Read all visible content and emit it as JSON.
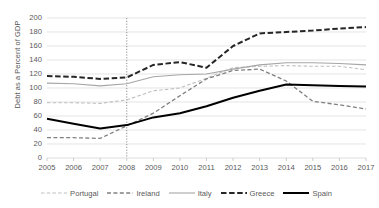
{
  "chart_data": {
    "type": "line",
    "title": "",
    "xlabel": "",
    "ylabel": "Debt as a Percent of GDP",
    "x": [
      2005,
      2006,
      2007,
      2008,
      2009,
      2010,
      2011,
      2012,
      2013,
      2014,
      2015,
      2016,
      2017
    ],
    "xlim": [
      2005,
      2017
    ],
    "ylim": [
      0,
      200
    ],
    "yticks": [
      0,
      20,
      40,
      60,
      80,
      100,
      120,
      140,
      160,
      180,
      200
    ],
    "xticks": [
      2005,
      2006,
      2007,
      2008,
      2009,
      2010,
      2011,
      2012,
      2013,
      2014,
      2015,
      2016,
      2017
    ],
    "grid": "horizontal",
    "legend_position": "bottom",
    "annotations": [
      {
        "type": "vertical-line",
        "x": 2008,
        "style": "dotted",
        "color": "#808080"
      }
    ],
    "series": [
      {
        "name": "Portugal",
        "color": "#bfbfbf",
        "style": "dashed",
        "width": 1.1,
        "values": [
          79,
          79,
          78,
          83,
          96,
          100,
          114,
          129,
          131,
          132,
          131,
          131,
          126
        ]
      },
      {
        "name": "Ireland",
        "color": "#808080",
        "style": "dashed",
        "width": 1.3,
        "values": [
          29,
          29,
          28,
          46,
          64,
          89,
          113,
          125,
          127,
          110,
          81,
          76,
          70
        ]
      },
      {
        "name": "Italy",
        "color": "#a6a6a6",
        "style": "solid",
        "width": 1.1,
        "values": [
          107,
          106,
          103,
          106,
          116,
          119,
          120,
          127,
          133,
          136,
          136,
          135,
          133
        ]
      },
      {
        "name": "Greece",
        "color": "#262626",
        "style": "dashed",
        "width": 2.0,
        "values": [
          117,
          116,
          113,
          115,
          133,
          137,
          129,
          160,
          178,
          180,
          182,
          185,
          187
        ]
      },
      {
        "name": "Spain",
        "color": "#000000",
        "style": "solid",
        "width": 2.0,
        "values": [
          56,
          49,
          42,
          47,
          58,
          64,
          74,
          86,
          96,
          105,
          104,
          103,
          102
        ]
      }
    ]
  },
  "axis": {
    "y_title": "Debt as a Percent of GDP",
    "y_ticks": [
      "200",
      "180",
      "160",
      "140",
      "120",
      "100",
      "80",
      "60",
      "40",
      "20",
      "0"
    ],
    "x_ticks": [
      "2005",
      "2006",
      "2007",
      "2008",
      "2009",
      "2010",
      "2011",
      "2012",
      "2013",
      "2014",
      "2015",
      "2016",
      "2017"
    ]
  },
  "legend": {
    "items": [
      {
        "label": "Portugal",
        "icon": "line-swatch-dashed-light"
      },
      {
        "label": "Ireland",
        "icon": "line-swatch-dashed-gray"
      },
      {
        "label": "Italy",
        "icon": "line-swatch-solid-gray"
      },
      {
        "label": "Greece",
        "icon": "line-swatch-dashed-dark"
      },
      {
        "label": "Spain",
        "icon": "line-swatch-solid-black"
      }
    ]
  },
  "colors": {
    "portugal": "#bfbfbf",
    "ireland": "#808080",
    "italy": "#a6a6a6",
    "greece": "#262626",
    "spain": "#000000",
    "grid": "#d9d9d9",
    "text": "#595959"
  }
}
